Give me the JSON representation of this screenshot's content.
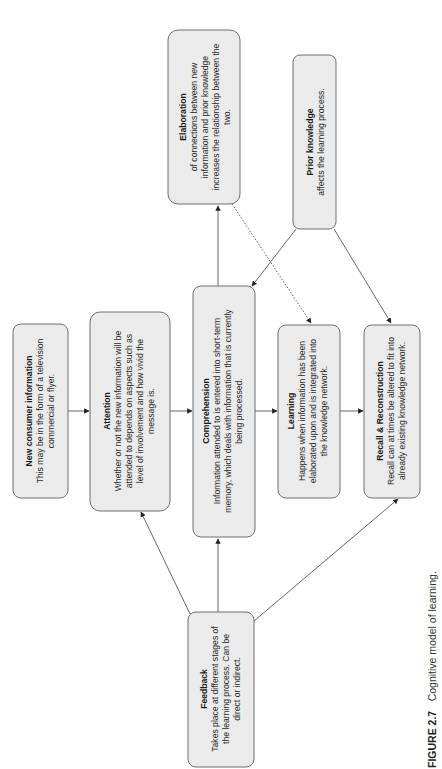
{
  "caption": {
    "label": "FIGURE 2.7",
    "text": "Cognitive model of learning."
  },
  "nodes": {
    "new_info": {
      "title": "New consumer information",
      "lines": [
        "This may be in the form of a television",
        "commercial or flyer."
      ]
    },
    "attention": {
      "title": "Attention",
      "lines": [
        "Whether or not the new information will be",
        "attended to depends on aspects such as",
        "level of involvement and how vivid the",
        "message is."
      ]
    },
    "comprehension": {
      "title": "Comprehension",
      "lines": [
        "Information attended to is entered into short-term",
        "memory, which deals with information that is currently",
        "being processed."
      ]
    },
    "learning": {
      "title": "Learning",
      "lines": [
        "Happens when information has been",
        "elaborated upon and is integrated into",
        "the knowledge network."
      ]
    },
    "recall": {
      "title": "Recall & Reconstruction",
      "lines": [
        "Recall can at times be altered to fit into",
        "already existing knowledge network."
      ]
    },
    "elaboration": {
      "title": "Elaboration",
      "lines": [
        "of connections between new",
        "information and prior knowledge",
        "increases the relationship between the",
        "two."
      ]
    },
    "prior_knowledge": {
      "title": "Prior knowledge",
      "lines": [
        "affects the learning process."
      ]
    },
    "feedback": {
      "title": "Feedback",
      "lines": [
        "Takes place at different stages of",
        "the learning process. Can be",
        "direct or indirect."
      ]
    }
  },
  "edges": [
    {
      "from": "New consumer information",
      "to": "Attention",
      "style": "solid"
    },
    {
      "from": "Attention",
      "to": "Comprehension",
      "style": "solid"
    },
    {
      "from": "Comprehension",
      "to": "Learning",
      "style": "solid"
    },
    {
      "from": "Learning",
      "to": "Recall & Reconstruction",
      "style": "solid"
    },
    {
      "from": "Comprehension",
      "to": "Elaboration",
      "style": "solid"
    },
    {
      "from": "Elaboration",
      "to": "Learning",
      "style": "dotted"
    },
    {
      "from": "Prior knowledge",
      "to": "Comprehension",
      "style": "solid"
    },
    {
      "from": "Prior knowledge",
      "to": "Recall & Reconstruction",
      "style": "solid"
    },
    {
      "from": "Feedback",
      "to": "Attention",
      "style": "solid"
    },
    {
      "from": "Feedback",
      "to": "Comprehension",
      "style": "solid"
    },
    {
      "from": "Feedback",
      "to": "Recall & Reconstruction",
      "style": "solid"
    }
  ]
}
